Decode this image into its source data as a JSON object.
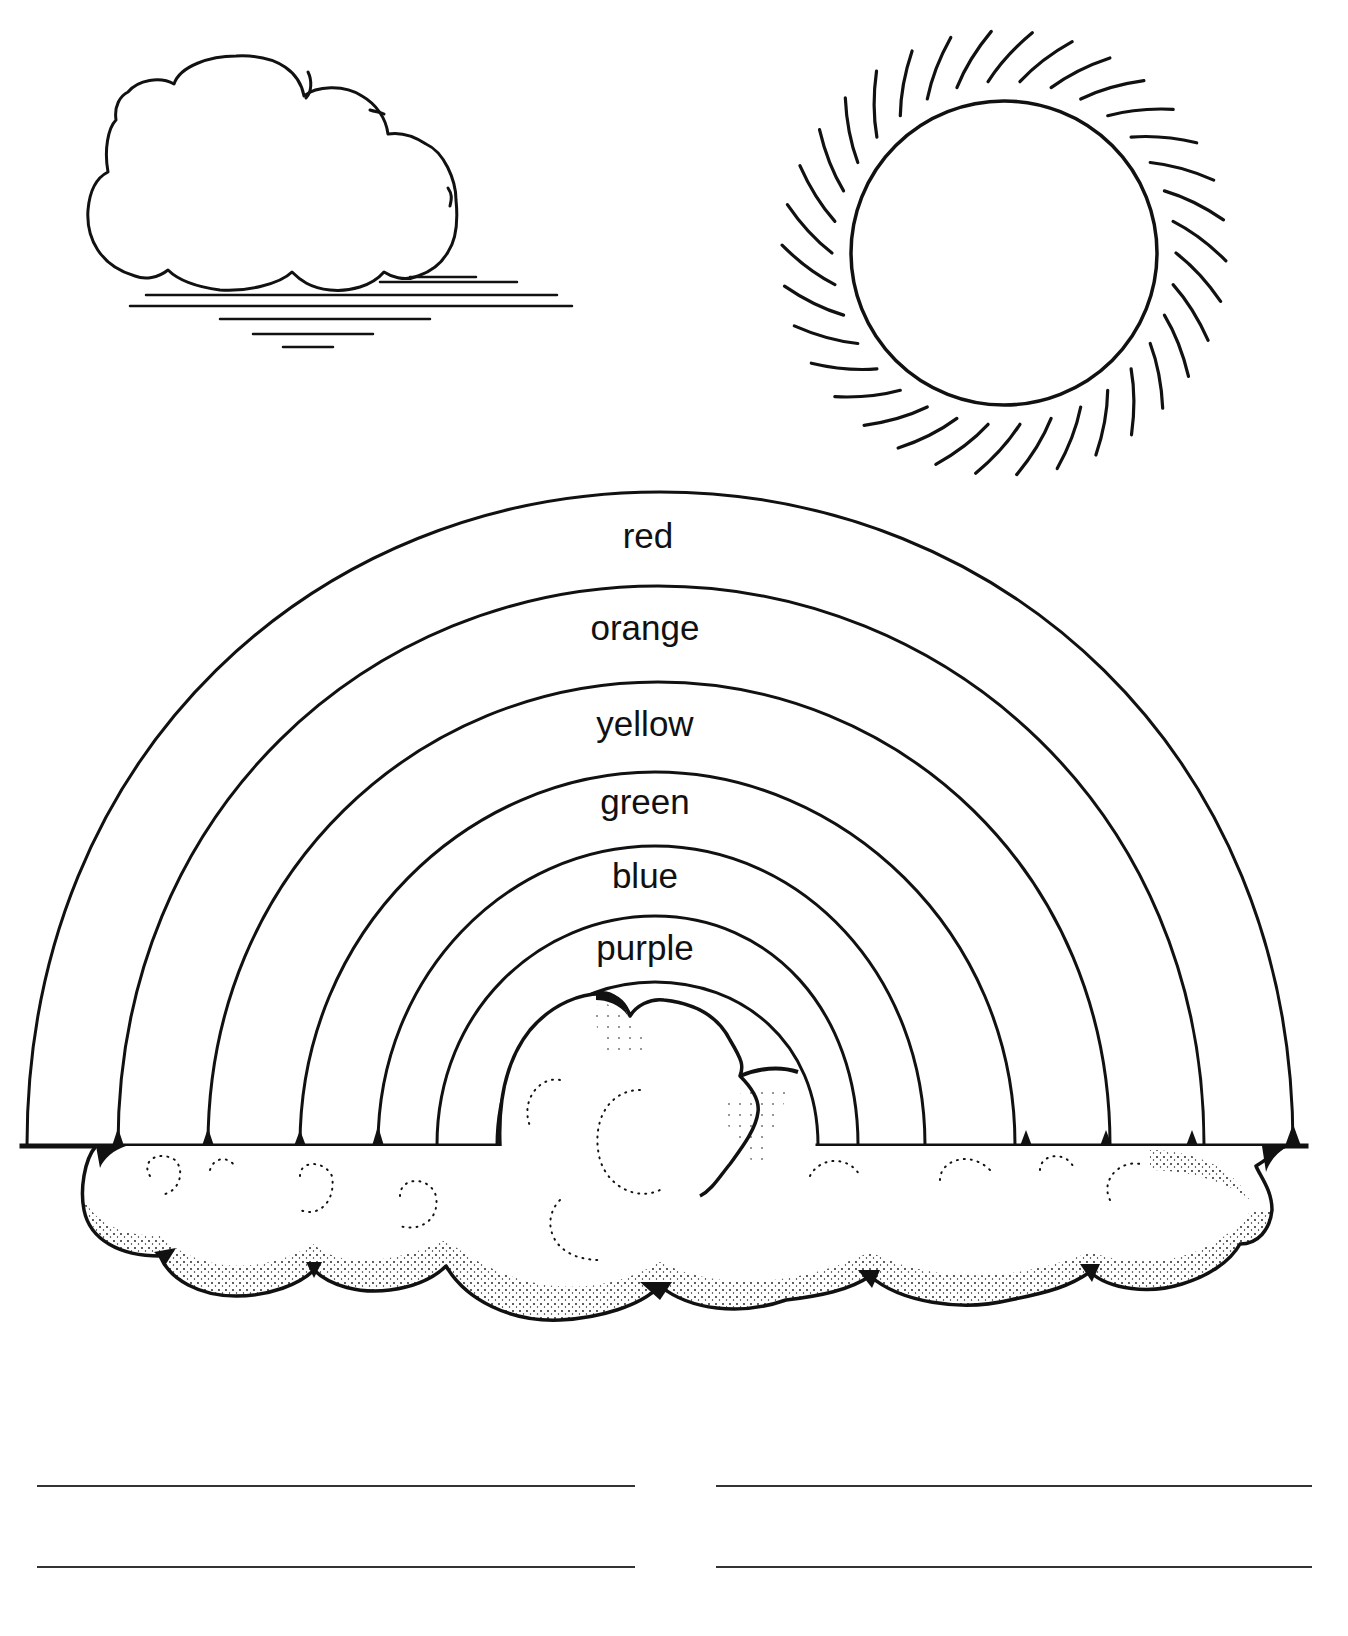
{
  "worksheet": {
    "title": "Rainbow coloring worksheet",
    "illustrations": {
      "cloud_top_left": {
        "icon": "cloud-icon"
      },
      "sun_top_right": {
        "icon": "sun-icon",
        "ray_count": 34
      },
      "rainbow": {
        "icon": "rainbow-icon"
      },
      "cloud_bank": {
        "icon": "cloud-bank-icon"
      }
    },
    "rainbow_bands": [
      {
        "label": "red",
        "color": "#e53935"
      },
      {
        "label": "orange",
        "color": "#fb8c00"
      },
      {
        "label": "yellow",
        "color": "#fdd835"
      },
      {
        "label": "green",
        "color": "#43a047"
      },
      {
        "label": "blue",
        "color": "#1e88e5"
      },
      {
        "label": "purple",
        "color": "#8e24aa"
      }
    ],
    "answer_lines": {
      "count": 4,
      "rows": 2,
      "columns": 2
    },
    "colors": {
      "ink": "#111111",
      "paper": "#ffffff",
      "rule": "#333333"
    }
  }
}
